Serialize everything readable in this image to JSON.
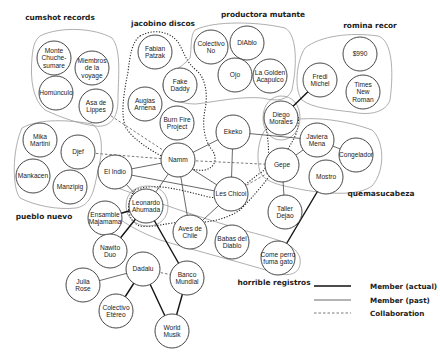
{
  "groups": [
    {
      "id": "cumshot",
      "label": "cumshot records",
      "label_x": 60,
      "label_y": 20
    },
    {
      "id": "jacobino",
      "label": "jacobino discos",
      "label_x": 163,
      "label_y": 26
    },
    {
      "id": "productora",
      "label": "productora mutante",
      "label_x": 263,
      "label_y": 17
    },
    {
      "id": "romina",
      "label": "romina recor",
      "label_x": 370,
      "label_y": 28
    },
    {
      "id": "pueblo",
      "label": "pueblo nuevo",
      "label_x": 44,
      "label_y": 219
    },
    {
      "id": "quemasucabeza",
      "label": "quemasucabeza",
      "label_x": 381,
      "label_y": 196
    },
    {
      "id": "horrible",
      "label": "horrible registros",
      "label_x": 274,
      "label_y": 285
    }
  ],
  "nodes": [
    {
      "id": "monte",
      "lines": [
        "Monte",
        "Chuche-",
        "sumare"
      ],
      "x": 54,
      "y": 58
    },
    {
      "id": "miembros",
      "lines": [
        "Miembros",
        "de la",
        "voyage"
      ],
      "x": 92,
      "y": 68
    },
    {
      "id": "homunculo",
      "lines": [
        "Homúnculo"
      ],
      "x": 56,
      "y": 93
    },
    {
      "id": "asa",
      "lines": [
        "Asa de",
        "Lippes"
      ],
      "x": 96,
      "y": 106
    },
    {
      "id": "fabian",
      "lines": [
        "Fabian",
        "Patzak"
      ],
      "x": 155,
      "y": 52
    },
    {
      "id": "fake",
      "lines": [
        "Fake",
        "Daddy"
      ],
      "x": 180,
      "y": 85
    },
    {
      "id": "augias",
      "lines": [
        "Augias",
        "Arnena"
      ],
      "x": 145,
      "y": 104
    },
    {
      "id": "burnfire",
      "lines": [
        "Burn Fire",
        "Project"
      ],
      "x": 177,
      "y": 123
    },
    {
      "id": "colectivono",
      "lines": [
        "Colectivo",
        "No"
      ],
      "x": 211,
      "y": 47
    },
    {
      "id": "diablo",
      "lines": [
        "DiAblo"
      ],
      "x": 247,
      "y": 43
    },
    {
      "id": "ojo",
      "lines": [
        "Ojo"
      ],
      "x": 235,
      "y": 75
    },
    {
      "id": "lagolden",
      "lines": [
        "La Golden",
        "Acapulco"
      ],
      "x": 270,
      "y": 76
    },
    {
      "id": "fredi",
      "lines": [
        "Fredi",
        "Michel"
      ],
      "x": 320,
      "y": 80
    },
    {
      "id": "s990",
      "lines": [
        "$990"
      ],
      "x": 360,
      "y": 54
    },
    {
      "id": "timesnew",
      "lines": [
        "Times",
        "New",
        "Roman"
      ],
      "x": 363,
      "y": 92
    },
    {
      "id": "diego",
      "lines": [
        "Diego",
        "Morales"
      ],
      "x": 281,
      "y": 118
    },
    {
      "id": "ekeko",
      "lines": [
        "Ekeko"
      ],
      "x": 233,
      "y": 132
    },
    {
      "id": "javiera",
      "lines": [
        "Javiera",
        "Mena"
      ],
      "x": 317,
      "y": 140
    },
    {
      "id": "congelador",
      "lines": [
        "Congelador"
      ],
      "x": 356,
      "y": 155
    },
    {
      "id": "mika",
      "lines": [
        "Mika",
        "Martini"
      ],
      "x": 40,
      "y": 140
    },
    {
      "id": "djef",
      "lines": [
        "Djef"
      ],
      "x": 78,
      "y": 152
    },
    {
      "id": "mankacen",
      "lines": [
        "Mankacen"
      ],
      "x": 33,
      "y": 176
    },
    {
      "id": "manzipig",
      "lines": [
        "Manzipig"
      ],
      "x": 70,
      "y": 187
    },
    {
      "id": "elindo",
      "lines": [
        "El Indio"
      ],
      "x": 115,
      "y": 172
    },
    {
      "id": "namm",
      "lines": [
        "Namm"
      ],
      "x": 178,
      "y": 160
    },
    {
      "id": "gepe",
      "lines": [
        "Gepe"
      ],
      "x": 282,
      "y": 165
    },
    {
      "id": "mostro",
      "lines": [
        "Mostro"
      ],
      "x": 326,
      "y": 177
    },
    {
      "id": "leskhicoi",
      "lines": [
        "Les Chicoi"
      ],
      "x": 231,
      "y": 194
    },
    {
      "id": "leonardo",
      "lines": [
        "Leonardo",
        "Ahumada"
      ],
      "x": 146,
      "y": 206
    },
    {
      "id": "ensamble",
      "lines": [
        "Ensamble",
        "Majamama"
      ],
      "x": 105,
      "y": 218
    },
    {
      "id": "taller",
      "lines": [
        "Taller",
        "Dejao"
      ],
      "x": 285,
      "y": 212
    },
    {
      "id": "aves",
      "lines": [
        "Aves de",
        "Chile"
      ],
      "x": 190,
      "y": 232
    },
    {
      "id": "babas",
      "lines": [
        "Babas del",
        "Diablo"
      ],
      "x": 232,
      "y": 242
    },
    {
      "id": "comeperro",
      "lines": [
        "Come perro",
        "fuma gato"
      ],
      "x": 278,
      "y": 258
    },
    {
      "id": "nawito",
      "lines": [
        "Nawito",
        "Duo"
      ],
      "x": 110,
      "y": 251
    },
    {
      "id": "dadalu",
      "lines": [
        "Dadalu"
      ],
      "x": 143,
      "y": 269
    },
    {
      "id": "bancomundial",
      "lines": [
        "Banco",
        "Mundial"
      ],
      "x": 187,
      "y": 278
    },
    {
      "id": "julia",
      "lines": [
        "Julia",
        "Rose"
      ],
      "x": 83,
      "y": 285
    },
    {
      "id": "colectivoetereo",
      "lines": [
        "Colectivo",
        "Etéreo"
      ],
      "x": 116,
      "y": 311
    },
    {
      "id": "worldmusik",
      "lines": [
        "World",
        "Musik"
      ],
      "x": 172,
      "y": 331
    }
  ],
  "edges": [
    {
      "from": "fredi",
      "to": "diego",
      "type": "actual"
    },
    {
      "from": "mostro",
      "to": "comeperro",
      "type": "actual"
    },
    {
      "from": "leonardo",
      "to": "ensamble",
      "type": "actual"
    },
    {
      "from": "leonardo",
      "to": "nawito",
      "type": "actual"
    },
    {
      "from": "leonardo",
      "to": "bancomundial",
      "type": "actual"
    },
    {
      "from": "dadalu",
      "to": "colectivoetereo",
      "type": "actual"
    },
    {
      "from": "dadalu",
      "to": "worldmusik",
      "type": "actual"
    },
    {
      "from": "bancomundial",
      "to": "worldmusik",
      "type": "actual"
    },
    {
      "from": "namm",
      "to": "elindo",
      "type": "past"
    },
    {
      "from": "namm",
      "to": "ekeko",
      "type": "past"
    },
    {
      "from": "namm",
      "to": "leskhicoi",
      "type": "past"
    },
    {
      "from": "namm",
      "to": "aves",
      "type": "past"
    },
    {
      "from": "namm",
      "to": "leonardo",
      "type": "past"
    },
    {
      "from": "ekeko",
      "to": "leskhicoi",
      "type": "past"
    },
    {
      "from": "ekeko",
      "to": "javiera",
      "type": "past"
    },
    {
      "from": "elindo",
      "to": "leonardo",
      "type": "past"
    },
    {
      "from": "elindo",
      "to": "leskhicoi",
      "type": "past"
    },
    {
      "from": "leskhicoi",
      "to": "aves",
      "type": "past"
    },
    {
      "from": "gepe",
      "to": "taller",
      "type": "past"
    },
    {
      "from": "gepe",
      "to": "javiera",
      "type": "past"
    },
    {
      "from": "javiera",
      "to": "congelador",
      "type": "past"
    },
    {
      "from": "dadalu",
      "to": "julia",
      "type": "past"
    },
    {
      "from": "djef",
      "to": "namm",
      "type": "collab"
    },
    {
      "from": "asa",
      "to": "namm",
      "type": "collab"
    },
    {
      "from": "namm",
      "to": "gepe",
      "type": "collab"
    },
    {
      "from": "leskhicoi",
      "to": "gepe",
      "type": "collab"
    },
    {
      "from": "dadalu",
      "to": "bancomundial",
      "type": "collab"
    }
  ],
  "legend": {
    "items": [
      {
        "label": "Member (actual)",
        "type": "actual"
      },
      {
        "label": "Member (past)",
        "type": "past"
      },
      {
        "label": "Collaboration",
        "type": "collab"
      }
    ]
  }
}
